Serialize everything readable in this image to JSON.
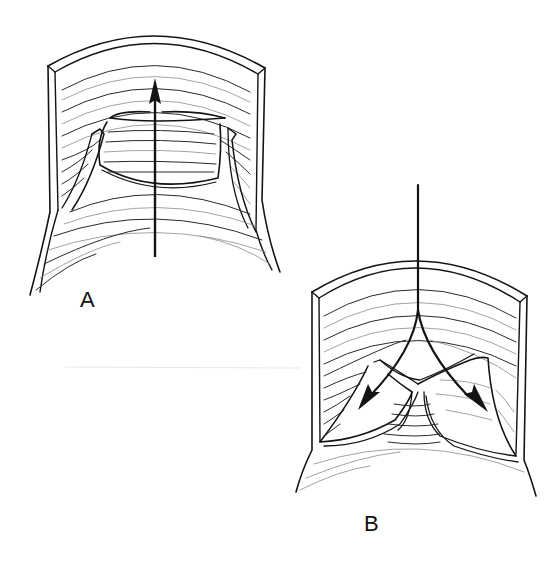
{
  "figure": {
    "panels": [
      {
        "id": "A",
        "label": "A",
        "arrow_direction": "up",
        "valve_state": "open"
      },
      {
        "id": "B",
        "label": "B",
        "arrow_direction": "down-split",
        "valve_state": "closed"
      }
    ]
  },
  "colors": {
    "ink": "#141414",
    "background": "#ffffff"
  }
}
